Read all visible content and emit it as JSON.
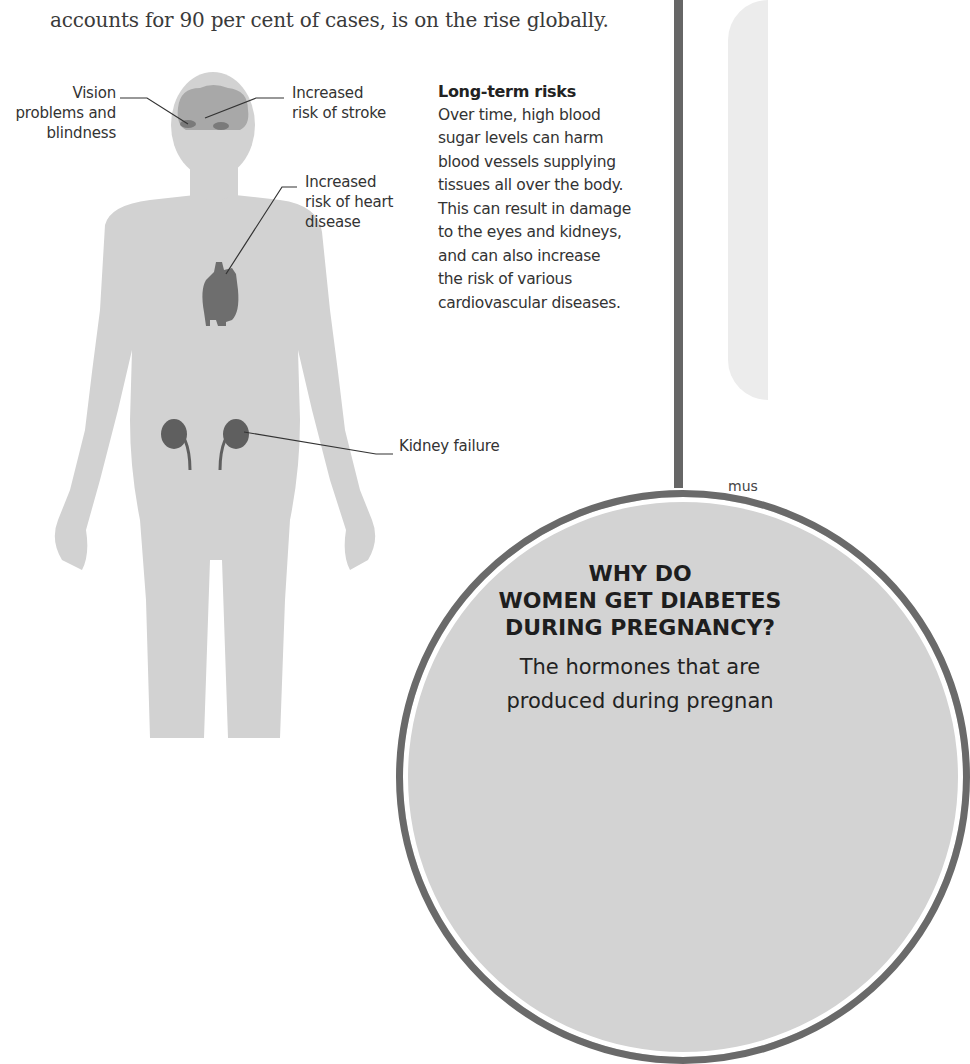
{
  "intro": {
    "line_cut": "Type 2 diabetes, which",
    "line": "accounts for 90 per cent of cases, is on the rise globally."
  },
  "labels": {
    "vision": [
      "Vision",
      "problems and",
      "blindness"
    ],
    "stroke": [
      "Increased",
      "risk of stroke"
    ],
    "heart": [
      "Increased",
      "risk of heart",
      "disease"
    ],
    "kidney": "Kidney failure"
  },
  "sidebar": {
    "title": "Long-term risks",
    "body": "Over time, high blood sugar levels can harm blood vessels supplying tissues all over the body. This can result in damage to the eyes and kidneys, and can also increase the risk of various cardiovascular diseases.",
    "lines": [
      "Over time, high blood",
      "sugar levels can harm",
      "blood vessels supplying",
      "tissues all over the body.",
      "This can result in damage",
      "to the eyes and kidneys,",
      "and can also increase",
      "the risk of various",
      "cardiovascular diseases."
    ]
  },
  "right_panel": {
    "fragment": "mus"
  },
  "callout": {
    "title_lines": [
      "WHY DO",
      "WOMEN GET DIABETES",
      "DURING PREGNANCY?"
    ],
    "body_lines": [
      "The hormones that are",
      "produced during pregnan"
    ]
  },
  "colors": {
    "body": "#d2d2d2",
    "organ": "#6e6e6e",
    "brain": "#a8a8a8",
    "divider": "#666666",
    "circle_border": "#6a6a6a",
    "circle_fill": "#d3d3d3"
  }
}
